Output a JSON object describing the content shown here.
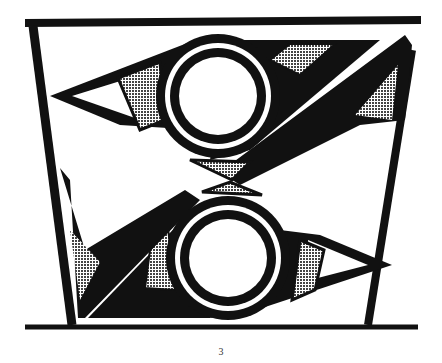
{
  "figure": {
    "page_number": "3",
    "colors": {
      "ink": "#111111",
      "paper": "#ffffff",
      "hatch": "#555555"
    }
  }
}
